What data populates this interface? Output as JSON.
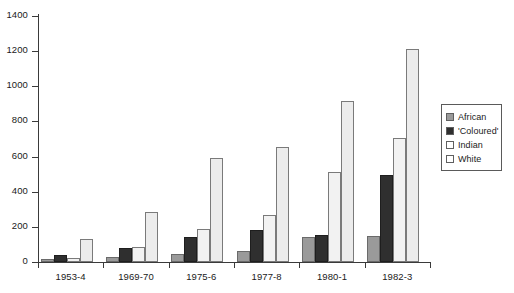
{
  "chart_data": {
    "type": "bar",
    "title": "",
    "subtitle": "",
    "xlabel": "",
    "ylabel": "",
    "ylim": [
      0,
      1400
    ],
    "ytick_values": [
      0,
      200,
      400,
      600,
      800,
      1000,
      1200,
      1400
    ],
    "ytick_labels": [
      "0",
      "200",
      "400",
      "600",
      "800",
      "1000",
      "1200",
      "1400"
    ],
    "grid": false,
    "legend_position": "right",
    "categories": [
      "1953-4",
      "1969-70",
      "1975-6",
      "1977-8",
      "1980-1",
      "1982-3"
    ],
    "series": [
      {
        "name": "African",
        "color": "#9a9a9a",
        "values": [
          20,
          30,
          45,
          60,
          145,
          150
        ]
      },
      {
        "name": "'Coloured'",
        "color": "#2f2f2f",
        "values": [
          40,
          80,
          140,
          185,
          155,
          495
        ]
      },
      {
        "name": "Indian",
        "color": "#f2f2f2",
        "values": [
          25,
          85,
          190,
          270,
          510,
          705
        ]
      },
      {
        "name": "White",
        "color": "#ececec",
        "values": [
          130,
          285,
          590,
          655,
          915,
          1210
        ]
      }
    ]
  }
}
